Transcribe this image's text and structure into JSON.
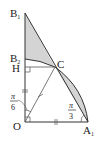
{
  "diagram": {
    "type": "geometry",
    "points": {
      "O": {
        "label": "O"
      },
      "A1": {
        "label": "A",
        "sub": "1"
      },
      "B1": {
        "label": "B",
        "sub": "1"
      },
      "B2": {
        "label": "B",
        "sub": "2"
      },
      "H": {
        "label": "H"
      },
      "C": {
        "label": "C"
      }
    },
    "angles": {
      "at_O": {
        "num": "π",
        "den": "6"
      },
      "at_A1": {
        "num": "π",
        "den": "3"
      }
    },
    "colors": {
      "stroke": "#333333",
      "shade": "#d4d4d4",
      "thin": "#555555"
    }
  }
}
